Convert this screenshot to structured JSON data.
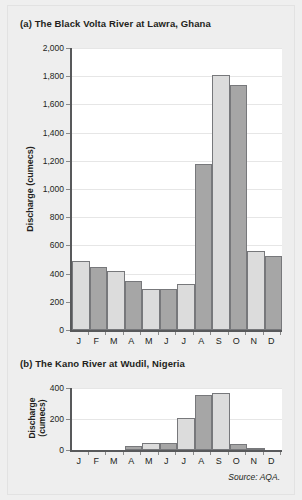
{
  "page": {
    "background": "#eeeeee",
    "source_note": "Source: AQA."
  },
  "colors": {
    "bar_light": "#dcdcdc",
    "bar_dark": "#a6a6a6",
    "bar_outline": "#77787b",
    "axis": "#58595b",
    "gridline": "#e6e6e6",
    "text": "#231f20",
    "plot_background": "#ffffff"
  },
  "chart_a": {
    "title": "(a) The Black Volta River at Lawra, Ghana",
    "ylabel": "Discharge (cumecs)"
  },
  "chart_b": {
    "title": "(b) The Kano River at Wudil, Nigeria",
    "ylabel_line1": "Discharge",
    "ylabel_line2": "(cumecs)"
  },
  "chart_data": [
    {
      "id": "a",
      "type": "bar",
      "title": "(a) The Black Volta River at Lawra, Ghana",
      "xlabel": "",
      "ylabel": "Discharge (cumecs)",
      "categories": [
        "J",
        "F",
        "M",
        "A",
        "M",
        "J",
        "J",
        "A",
        "S",
        "O",
        "N",
        "D"
      ],
      "values": [
        490,
        450,
        420,
        345,
        290,
        290,
        325,
        1180,
        1810,
        1740,
        560,
        525
      ],
      "bar_colors": [
        "#dcdcdc",
        "#a6a6a6",
        "#dcdcdc",
        "#a6a6a6",
        "#dcdcdc",
        "#a6a6a6",
        "#dcdcdc",
        "#a6a6a6",
        "#dcdcdc",
        "#a6a6a6",
        "#dcdcdc",
        "#a6a6a6"
      ],
      "ylim": [
        0,
        2000
      ],
      "ytick_values": [
        0,
        200,
        400,
        600,
        800,
        1000,
        1200,
        1400,
        1600,
        1800,
        2000
      ],
      "ytick_labels": [
        "0",
        "200",
        "400",
        "600",
        "800",
        "1,000",
        "1,200",
        "1,400",
        "1,600",
        "1,800",
        "2,000"
      ],
      "grid": true,
      "legend": "none"
    },
    {
      "id": "b",
      "type": "bar",
      "title": "(b) The Kano River at Wudil, Nigeria",
      "xlabel": "",
      "ylabel": "Discharge (cumecs)",
      "categories": [
        "J",
        "F",
        "M",
        "A",
        "M",
        "J",
        "J",
        "A",
        "S",
        "O",
        "N",
        "D"
      ],
      "values": [
        0,
        0,
        0,
        25,
        45,
        48,
        205,
        355,
        367,
        40,
        12,
        0
      ],
      "bar_colors": [
        "#dcdcdc",
        "#a6a6a6",
        "#dcdcdc",
        "#a6a6a6",
        "#dcdcdc",
        "#a6a6a6",
        "#dcdcdc",
        "#a6a6a6",
        "#dcdcdc",
        "#a6a6a6",
        "#dcdcdc",
        "#a6a6a6"
      ],
      "ylim": [
        0,
        400
      ],
      "ytick_values": [
        0,
        200,
        400
      ],
      "ytick_labels": [
        "0",
        "200",
        "400"
      ],
      "grid": true,
      "legend": "none"
    }
  ]
}
